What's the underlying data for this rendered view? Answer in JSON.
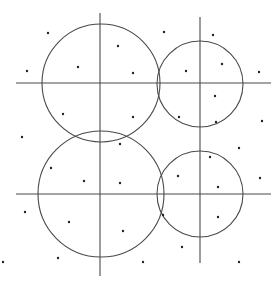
{
  "diagram": {
    "width": 280,
    "height": 285,
    "background": "#ffffff",
    "stroke_color": "#4a4a4a",
    "dot_color": "#222222",
    "lines": [
      {
        "id": "vertical-left",
        "x1": 100,
        "y1": 13,
        "x2": 100,
        "y2": 276
      },
      {
        "id": "vertical-right",
        "x1": 200,
        "y1": 17,
        "x2": 200,
        "y2": 263
      },
      {
        "id": "horizontal-top",
        "x1": 16,
        "y1": 83,
        "x2": 271,
        "y2": 83
      },
      {
        "id": "horizontal-bottom",
        "x1": 16,
        "y1": 194,
        "x2": 271,
        "y2": 194
      }
    ],
    "circles": [
      {
        "id": "circle-top-left",
        "cx": 101,
        "cy": 83,
        "r": 59
      },
      {
        "id": "circle-top-right",
        "cx": 200,
        "cy": 84,
        "r": 43
      },
      {
        "id": "circle-bottom-left",
        "cx": 101,
        "cy": 194,
        "r": 63
      },
      {
        "id": "circle-bottom-right",
        "cx": 200,
        "cy": 194,
        "r": 43
      }
    ],
    "dots": [
      {
        "x": 48,
        "y": 33
      },
      {
        "x": 27,
        "y": 71
      },
      {
        "x": 78,
        "y": 67
      },
      {
        "x": 118,
        "y": 46
      },
      {
        "x": 133,
        "y": 73
      },
      {
        "x": 164,
        "y": 32
      },
      {
        "x": 213,
        "y": 35
      },
      {
        "x": 222,
        "y": 64
      },
      {
        "x": 186,
        "y": 71
      },
      {
        "x": 259,
        "y": 72
      },
      {
        "x": 63,
        "y": 114
      },
      {
        "x": 133,
        "y": 117
      },
      {
        "x": 215,
        "y": 96
      },
      {
        "x": 216,
        "y": 122
      },
      {
        "x": 179,
        "y": 117
      },
      {
        "x": 262,
        "y": 121
      },
      {
        "x": 22,
        "y": 137
      },
      {
        "x": 120,
        "y": 144
      },
      {
        "x": 120,
        "y": 183
      },
      {
        "x": 51,
        "y": 168
      },
      {
        "x": 84,
        "y": 181
      },
      {
        "x": 210,
        "y": 157
      },
      {
        "x": 239,
        "y": 148
      },
      {
        "x": 178,
        "y": 176
      },
      {
        "x": 218,
        "y": 187
      },
      {
        "x": 260,
        "y": 178
      },
      {
        "x": 25,
        "y": 212
      },
      {
        "x": 69,
        "y": 222
      },
      {
        "x": 123,
        "y": 231
      },
      {
        "x": 163,
        "y": 215
      },
      {
        "x": 218,
        "y": 217
      },
      {
        "x": 182,
        "y": 247
      },
      {
        "x": 58,
        "y": 258
      },
      {
        "x": 143,
        "y": 262
      },
      {
        "x": 239,
        "y": 262
      },
      {
        "x": 3,
        "y": 262
      }
    ]
  }
}
